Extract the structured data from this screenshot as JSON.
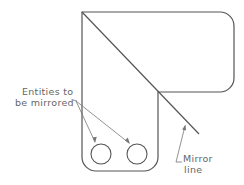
{
  "diagram": {
    "type": "cad-mirror-illustration",
    "colors": {
      "outline": "#555555",
      "leader": "#777777",
      "text": "#666666",
      "background": "#ffffff"
    },
    "labels": {
      "entities_line1": "Entities to",
      "entities_line2": "be mirrored",
      "mirror_line1": "Mirror",
      "mirror_line2": "line"
    },
    "entities": [
      {
        "shape": "circle",
        "cx": 101,
        "cy": 154,
        "r": 10
      },
      {
        "shape": "circle",
        "cx": 137,
        "cy": 154,
        "r": 10
      }
    ],
    "mirror_line": {
      "x1": 82,
      "y1": 12,
      "x2": 199,
      "y2": 134
    }
  }
}
